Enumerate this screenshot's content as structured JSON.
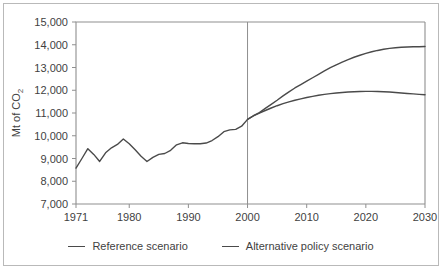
{
  "chart_data": {
    "type": "line",
    "title": "",
    "xlabel": "",
    "ylabel": "Mt of CO",
    "ylabel_sub": "2",
    "xlim": [
      1971,
      2030
    ],
    "ylim": [
      7000,
      15000
    ],
    "grid": false,
    "legend_position": "bottom",
    "x_ticks": [
      "1971",
      "1980",
      "1990",
      "2000",
      "2010",
      "2020",
      "2030"
    ],
    "x_tick_values": [
      1971,
      1980,
      1990,
      2000,
      2010,
      2020,
      2030
    ],
    "y_ticks": [
      "7,000",
      "8,000",
      "9,000",
      "10,000",
      "11,000",
      "12,000",
      "13,000",
      "14,000",
      "15,000"
    ],
    "y_tick_values": [
      7000,
      8000,
      9000,
      10000,
      11000,
      12000,
      13000,
      14000,
      15000
    ],
    "divider_year": 2000,
    "series": [
      {
        "name": "Reference scenario",
        "x": [
          1971,
          1972,
          1973,
          1974,
          1975,
          1976,
          1977,
          1978,
          1979,
          1980,
          1981,
          1982,
          1983,
          1984,
          1985,
          1986,
          1987,
          1988,
          1989,
          1990,
          1991,
          1992,
          1993,
          1994,
          1995,
          1996,
          1997,
          1998,
          1999,
          2000,
          2001,
          2002,
          2003,
          2004,
          2005,
          2006,
          2007,
          2008,
          2009,
          2010,
          2011,
          2012,
          2013,
          2014,
          2015,
          2016,
          2017,
          2018,
          2019,
          2020,
          2021,
          2022,
          2023,
          2024,
          2025,
          2026,
          2027,
          2028,
          2029,
          2030
        ],
        "values": [
          8580,
          9000,
          9430,
          9180,
          8870,
          9250,
          9470,
          9620,
          9860,
          9650,
          9380,
          9100,
          8870,
          9050,
          9180,
          9220,
          9360,
          9600,
          9690,
          9660,
          9650,
          9650,
          9680,
          9790,
          9960,
          10180,
          10260,
          10280,
          10420,
          10720,
          10880,
          11020,
          11200,
          11380,
          11560,
          11750,
          11930,
          12100,
          12250,
          12400,
          12550,
          12700,
          12850,
          12990,
          13120,
          13240,
          13350,
          13450,
          13540,
          13620,
          13690,
          13750,
          13800,
          13840,
          13870,
          13890,
          13900,
          13910,
          13915,
          13920
        ]
      },
      {
        "name": "Alternative policy scenario",
        "x": [
          2000,
          2001,
          2002,
          2003,
          2004,
          2005,
          2006,
          2007,
          2008,
          2009,
          2010,
          2011,
          2012,
          2013,
          2014,
          2015,
          2016,
          2017,
          2018,
          2019,
          2020,
          2021,
          2022,
          2023,
          2024,
          2025,
          2026,
          2027,
          2028,
          2029,
          2030
        ],
        "values": [
          10720,
          10870,
          10990,
          11110,
          11220,
          11320,
          11410,
          11490,
          11560,
          11620,
          11680,
          11730,
          11780,
          11820,
          11850,
          11880,
          11900,
          11920,
          11935,
          11945,
          11950,
          11950,
          11945,
          11935,
          11920,
          11900,
          11880,
          11860,
          11840,
          11820,
          11800
        ]
      }
    ]
  },
  "legend": {
    "items": [
      {
        "label": "Reference scenario"
      },
      {
        "label": "Alternative policy scenario"
      }
    ]
  }
}
